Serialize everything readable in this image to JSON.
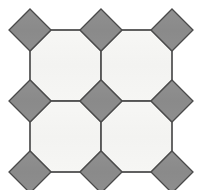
{
  "figure": {
    "name": "truncated-square-tiling",
    "vertex_configuration": "4.8.8",
    "width": 198,
    "height": 190,
    "background_color": "#ffffff"
  },
  "palette": {
    "square_fill": "#8c8c8c",
    "square_stroke": "#4a4a4a",
    "octagon_fill": "#f5f5f3",
    "octagon_stroke": "#4a4a4a",
    "edge_stroke": "#555555",
    "background": "#ffffff"
  },
  "geometry": {
    "grid_pitch": 71,
    "square_half_diagonal": 21,
    "octagon_side": 29.3,
    "stroke_width": 1.3,
    "square_centers_x": [
      30,
      101,
      172
    ],
    "square_centers_y": [
      30,
      101,
      172
    ],
    "octagon_centers_x": [
      65.5,
      136.5
    ],
    "octagon_centers_y": [
      65.5,
      136.5
    ]
  },
  "chart_data": {
    "type": "diagram",
    "tiles": {
      "squares": [
        {
          "id": "square-r0-c0",
          "cx": 30,
          "cy": 30,
          "half_diagonal": 21,
          "fill": "#8c8c8c",
          "position": "top-left"
        },
        {
          "id": "square-r0-c1",
          "cx": 101,
          "cy": 30,
          "half_diagonal": 21,
          "fill": "#8c8c8c",
          "position": "top-center"
        },
        {
          "id": "square-r0-c2",
          "cx": 172,
          "cy": 30,
          "half_diagonal": 21,
          "fill": "#8c8c8c",
          "position": "top-right"
        },
        {
          "id": "square-r1-c0",
          "cx": 30,
          "cy": 101,
          "half_diagonal": 21,
          "fill": "#8c8c8c",
          "position": "middle-left"
        },
        {
          "id": "square-r1-c1",
          "cx": 101,
          "cy": 101,
          "half_diagonal": 21,
          "fill": "#8c8c8c",
          "position": "center"
        },
        {
          "id": "square-r1-c2",
          "cx": 172,
          "cy": 101,
          "half_diagonal": 21,
          "fill": "#8c8c8c",
          "position": "middle-right"
        },
        {
          "id": "square-r2-c0",
          "cx": 30,
          "cy": 172,
          "half_diagonal": 21,
          "fill": "#8c8c8c",
          "position": "bottom-left"
        },
        {
          "id": "square-r2-c1",
          "cx": 101,
          "cy": 172,
          "half_diagonal": 21,
          "fill": "#8c8c8c",
          "position": "bottom-center"
        },
        {
          "id": "square-r2-c2",
          "cx": 172,
          "cy": 172,
          "half_diagonal": 21,
          "fill": "#8c8c8c",
          "position": "bottom-right"
        }
      ],
      "octagons": [
        {
          "id": "octagon-r0-c0",
          "cx": 65.5,
          "cy": 65.5,
          "fill": "#f5f5f3",
          "position": "upper-left"
        },
        {
          "id": "octagon-r0-c1",
          "cx": 136.5,
          "cy": 65.5,
          "fill": "#f5f5f3",
          "position": "upper-right"
        },
        {
          "id": "octagon-r1-c0",
          "cx": 65.5,
          "cy": 136.5,
          "fill": "#f5f5f3",
          "position": "lower-left"
        },
        {
          "id": "octagon-r1-c1",
          "cx": 136.5,
          "cy": 136.5,
          "fill": "#f5f5f3",
          "position": "lower-right"
        }
      ]
    },
    "counts": {
      "squares_total": 9,
      "octagons_total": 4,
      "rows": 3,
      "columns": 3
    }
  }
}
